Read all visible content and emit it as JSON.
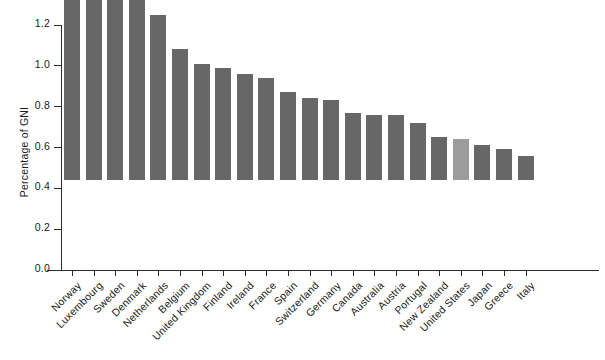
{
  "chart_data": {
    "type": "bar",
    "title": "",
    "subtitle": "",
    "xlabel": "",
    "ylabel": "Percentage of GNI",
    "ylim": [
      0.0,
      1.2
    ],
    "ytick_labels": [
      "0.0",
      "0.2",
      "0.4",
      "0.6",
      "0.8",
      "1.0",
      "1.2"
    ],
    "ytick_values": [
      0.0,
      0.2,
      0.4,
      0.6,
      0.8,
      1.0,
      1.2
    ],
    "grid": false,
    "legend": null,
    "categories": [
      "Norway",
      "Luxembourg",
      "Sweden",
      "Denmark",
      "Netherlands",
      "Belgium",
      "United Kingdom",
      "Finland",
      "Ireland",
      "France",
      "Spain",
      "Switzerland",
      "Germany",
      "Canada",
      "Australia",
      "Austria",
      "Portugal",
      "New Zealand",
      "United States",
      "Japan",
      "Greece",
      "Italy"
    ],
    "values": [
      1.1,
      1.05,
      0.97,
      0.91,
      0.81,
      0.64,
      0.57,
      0.55,
      0.52,
      0.5,
      0.43,
      0.4,
      0.39,
      0.33,
      0.32,
      0.32,
      0.28,
      0.21,
      0.2,
      0.17,
      0.15,
      0.12
    ],
    "highlight_category": "United States",
    "colors": {
      "bar": "#676767",
      "bar_highlight": "#9c9c9c",
      "axis": "#2b2b2b",
      "text": "#1a1a1a",
      "background": "#ffffff"
    }
  }
}
